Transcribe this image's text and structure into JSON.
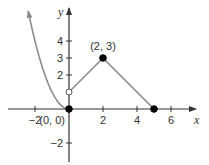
{
  "chart_data": {
    "type": "line",
    "title": "",
    "xlabel": "x",
    "ylabel": "y",
    "xlim": [
      -3.5,
      7.5
    ],
    "ylim": [
      -3.1,
      6.3
    ],
    "grid": false,
    "x_ticks": [
      -2,
      2,
      4,
      6
    ],
    "x_tick_labels": [
      "−2",
      "2",
      "4",
      "6"
    ],
    "y_ticks": [
      -2,
      2,
      3,
      4
    ],
    "y_tick_labels": [
      "−2",
      "2",
      "3",
      "4"
    ],
    "series": [
      {
        "name": "parabola",
        "kind": "curve",
        "equation": "y = x^2, x <= 0",
        "x": [
          -2.4,
          -2,
          -1.5,
          -1,
          -0.5,
          0
        ],
        "y": [
          5.76,
          4,
          2.25,
          1,
          0.25,
          0
        ],
        "arrow_at_start": true
      },
      {
        "name": "segment-1",
        "kind": "line",
        "x": [
          0,
          2
        ],
        "y": [
          1,
          3
        ]
      },
      {
        "name": "segment-2",
        "kind": "line",
        "x": [
          2,
          5
        ],
        "y": [
          3,
          0
        ]
      }
    ],
    "points": [
      {
        "x": 0,
        "y": 0,
        "filled": true,
        "label": "(0, 0)"
      },
      {
        "x": 0,
        "y": 1,
        "filled": false,
        "label": ""
      },
      {
        "x": 2,
        "y": 3,
        "filled": true,
        "label": "(2, 3)"
      },
      {
        "x": 5,
        "y": 0,
        "filled": true,
        "label": ""
      }
    ],
    "colors": {
      "axes": "#333333",
      "curve": "#8a8a8a",
      "points": "#000000"
    }
  }
}
